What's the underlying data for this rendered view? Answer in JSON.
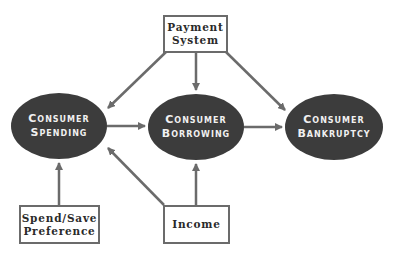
{
  "diagram": {
    "colors": {
      "node_fill": "#3c3c3c",
      "node_text": "#f0f0f0",
      "arrow": "#6b6b6b",
      "box_border": "#6b6b6b",
      "box_text": "#2a2a2a"
    },
    "nodes": [
      {
        "id": "spending",
        "line1": "Consumer",
        "line2": "Spending"
      },
      {
        "id": "borrowing",
        "line1": "Consumer",
        "line2": "Borrowing"
      },
      {
        "id": "bankruptcy",
        "line1": "Consumer",
        "line2": "Bankruptcy"
      }
    ],
    "boxes": [
      {
        "id": "payment",
        "line1": "Payment",
        "line2": "System"
      },
      {
        "id": "spendsave",
        "line1": "Spend/Save",
        "line2": "Preference"
      },
      {
        "id": "income",
        "line1": "Income"
      }
    ],
    "edges": [
      {
        "from": "payment",
        "to": "spending"
      },
      {
        "from": "payment",
        "to": "borrowing"
      },
      {
        "from": "payment",
        "to": "bankruptcy"
      },
      {
        "from": "spending",
        "to": "borrowing"
      },
      {
        "from": "borrowing",
        "to": "bankruptcy"
      },
      {
        "from": "spendsave",
        "to": "spending"
      },
      {
        "from": "income",
        "to": "spending"
      },
      {
        "from": "income",
        "to": "borrowing"
      }
    ]
  }
}
